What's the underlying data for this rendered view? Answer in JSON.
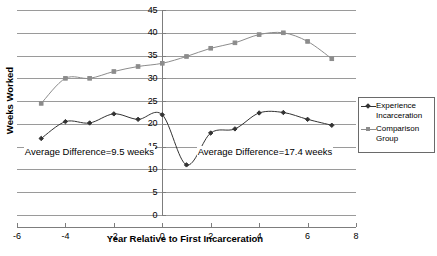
{
  "chart_data": {
    "type": "line",
    "title": "",
    "xlabel": "Year Relative to First Incarceration",
    "ylabel": "Weeks Worked",
    "x": [
      -5,
      -4,
      -3,
      -2,
      -1,
      0,
      1,
      2,
      3,
      4,
      5,
      6,
      7
    ],
    "xlim": [
      -6,
      8
    ],
    "ylim": [
      0,
      45
    ],
    "xticks": [
      "-6",
      "-4",
      "-2",
      "0",
      "2",
      "4",
      "6",
      "8"
    ],
    "xtick_values": [
      -6,
      -4,
      -2,
      0,
      2,
      4,
      6,
      8
    ],
    "yticks": [
      "0",
      "5",
      "10",
      "15",
      "20",
      "25",
      "30",
      "35",
      "40",
      "45"
    ],
    "ytick_values": [
      0,
      5,
      10,
      15,
      20,
      25,
      30,
      35,
      40,
      45
    ],
    "grid": true,
    "grid_axis": "y",
    "legend_position": "right",
    "series": [
      {
        "name": "Experience Incarceration",
        "color": "#333333",
        "marker": "diamond",
        "values": [
          16.8,
          20.5,
          20.2,
          22.2,
          21.0,
          22.0,
          11.0,
          18.0,
          18.9,
          22.4,
          22.5,
          21.0,
          19.7
        ]
      },
      {
        "name": "Comparison Group",
        "color": "#8c8c8c",
        "marker": "square",
        "values": [
          24.5,
          30.0,
          30.0,
          31.5,
          32.6,
          33.3,
          34.8,
          36.6,
          37.8,
          39.6,
          40.0,
          38.1,
          34.3
        ]
      }
    ],
    "annotations": [
      {
        "text": "Average Difference=9.5 weeks",
        "x_pct": 2.0,
        "y_value": 14.0
      },
      {
        "text": "Average Difference=17.4 weeks",
        "x_pct": 53.0,
        "y_value": 14.0
      }
    ]
  },
  "legend": {
    "entries": [
      {
        "label_line1": "Experience",
        "label_line2": "Incarceration"
      },
      {
        "label_line1": "Comparison",
        "label_line2": "Group"
      }
    ]
  },
  "axes": {
    "y_title": "Weeks Worked",
    "x_title": "Year Relative to First Incarceration"
  },
  "colors": {
    "series_dark": "#333333",
    "series_gray": "#8c8c8c",
    "gridline": "#9a9a9a",
    "axis": "#7d7d7d",
    "text": "#000000",
    "background": "#ffffff"
  }
}
